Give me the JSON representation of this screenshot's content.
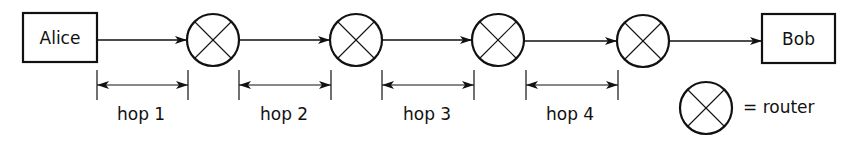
{
  "nodes": {
    "source": {
      "label": "Alice"
    },
    "destination": {
      "label": "Bob"
    },
    "routers": [
      {
        "id": "router-1"
      },
      {
        "id": "router-2"
      },
      {
        "id": "router-3"
      },
      {
        "id": "router-4"
      }
    ]
  },
  "hops": [
    {
      "label": "hop 1"
    },
    {
      "label": "hop 2"
    },
    {
      "label": "hop 3"
    },
    {
      "label": "hop 4"
    }
  ],
  "legend": {
    "router_symbol": "circle-x-icon",
    "label": "= router"
  },
  "colors": {
    "stroke": "#111111",
    "background": "#ffffff"
  }
}
